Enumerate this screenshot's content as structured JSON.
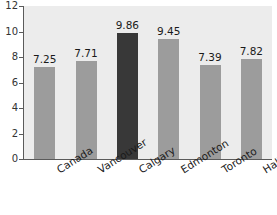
{
  "chart_data": {
    "type": "bar",
    "title": "",
    "subtitle": "",
    "xlabel": "",
    "ylabel": "",
    "categories": [
      "Canada",
      "Vancouver",
      "Calgary",
      "Edmonton",
      "Toronto",
      "Halifax"
    ],
    "values": [
      7.25,
      7.71,
      9.86,
      9.45,
      7.39,
      7.82
    ],
    "value_labels": [
      "7.25",
      "7.71",
      "9.86",
      "9.45",
      "7.39",
      "7.82"
    ],
    "ylim": [
      0,
      12
    ],
    "y_ticks": [
      0,
      2,
      4,
      6,
      8,
      10,
      12
    ],
    "y_tick_labels": [
      "0",
      "2",
      "4",
      "6",
      "8",
      "10",
      "12"
    ],
    "grid": false,
    "legend": "none",
    "highlight_category": "Calgary",
    "colors": {
      "bar": "#9c9c9c",
      "bar_highlight": "#383838",
      "plot_background": "#ececec",
      "canvas_background": "#ffffff",
      "axis": "#5a5a5a",
      "text": "#1a1a1a"
    }
  }
}
